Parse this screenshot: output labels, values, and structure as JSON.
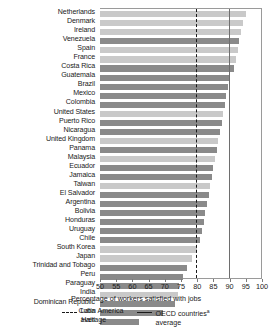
{
  "chart_data": {
    "type": "bar",
    "orientation": "horizontal",
    "title": "",
    "xlabel": "Percentage of workers satisfied with jobs",
    "ylabel": "",
    "xlim": [
      50,
      100
    ],
    "xticks": [
      50,
      55,
      60,
      65,
      70,
      75,
      80,
      85,
      90,
      95,
      100
    ],
    "grid": false,
    "legend_position": "bottom",
    "categories": [
      "Netherlands",
      "Denmark",
      "Ireland",
      "Venezuela",
      "Spain",
      "France",
      "Costa Rica",
      "Guatemala",
      "Brazil",
      "Mexico",
      "Colombia",
      "United States",
      "Puerto Rico",
      "Nicaragua",
      "United Kingdom",
      "Panama",
      "Malaysia",
      "Ecuador",
      "Jamaica",
      "Taiwan",
      "El Salvador",
      "Argentina",
      "Bolivia",
      "Honduras",
      "Uruguay",
      "Chile",
      "South Korea",
      "Japan",
      "Trinidad and Tobago",
      "Peru",
      "Paraguay",
      "India",
      "Dominican Republic",
      "Cuba",
      "Haiti"
    ],
    "values": [
      95.0,
      94.0,
      93.5,
      93.0,
      92.5,
      92.0,
      91.5,
      90.0,
      89.5,
      89.0,
      88.5,
      88.0,
      87.5,
      87.0,
      86.5,
      86.0,
      85.5,
      85.0,
      84.5,
      84.0,
      83.5,
      83.0,
      82.5,
      82.0,
      81.5,
      81.0,
      80.0,
      78.5,
      77.0,
      75.5,
      74.5,
      74.0,
      73.0,
      69.5,
      62.0
    ],
    "series_groups": [
      "oecd",
      "oecd",
      "oecd",
      "latam",
      "oecd",
      "oecd",
      "latam",
      "latam",
      "latam",
      "latam",
      "latam",
      "oecd",
      "latam",
      "latam",
      "oecd",
      "latam",
      "oecd",
      "latam",
      "latam",
      "oecd",
      "latam",
      "latam",
      "latam",
      "latam",
      "latam",
      "latam",
      "oecd",
      "oecd",
      "latam",
      "latam",
      "latam",
      "oecd",
      "latam",
      "latam",
      "latam"
    ],
    "reference_lines": [
      {
        "name": "latin-america-average",
        "value": 79.5,
        "style": "dashed"
      },
      {
        "name": "oecd-countries-average",
        "value": 89.8,
        "style": "solid"
      }
    ],
    "legend": [
      {
        "key": "latam-average",
        "style": "dashed",
        "line1": "Latin America",
        "line2": "average",
        "superscript": ""
      },
      {
        "key": "oecd-average",
        "style": "solid",
        "line1": "OECD countries",
        "line2": "average",
        "superscript": "a"
      }
    ],
    "colors": {
      "oecd_bar": "#c9c9c9",
      "latam_bar": "#8a8a8a",
      "axis": "#9a9a9a",
      "text": "#1a1a1a"
    }
  }
}
